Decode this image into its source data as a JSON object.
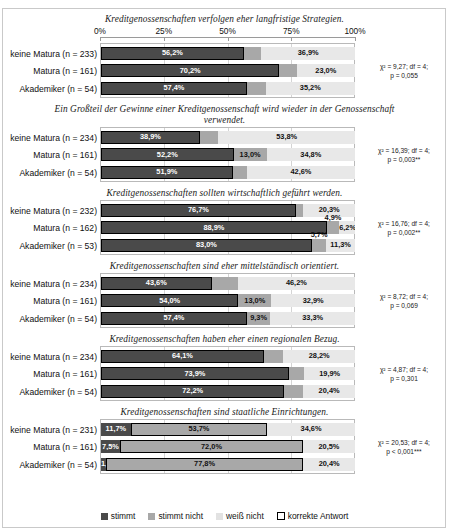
{
  "axis": {
    "ticks": [
      "0%",
      "25%",
      "50%",
      "75%",
      "100%"
    ],
    "values": [
      0,
      25,
      50,
      75,
      100
    ],
    "min": 0,
    "max": 100
  },
  "legend": {
    "items": [
      {
        "label": "stimmt",
        "color": "#4a4a4a",
        "key": "stimmt"
      },
      {
        "label": "stimmt nicht",
        "color": "#a8a8a8",
        "key": "stimmt_nicht"
      },
      {
        "label": "weiß nicht",
        "color": "#e2e2e2",
        "key": "weiss_nicht"
      },
      {
        "label": "korrekte Antwort",
        "color": "#ffffff",
        "key": "korrekte_antwort"
      }
    ]
  },
  "chart_data": {
    "type": "bar",
    "orientation": "horizontal",
    "stacked": true,
    "xlabel": "",
    "ylabel": "",
    "xlim": [
      0,
      100
    ],
    "grid": true,
    "legend_position": "bottom",
    "series": [
      {
        "name": "stimmt",
        "color": "#4a4a4a"
      },
      {
        "name": "stimmt nicht",
        "color": "#a8a8a8"
      },
      {
        "name": "weiß nicht",
        "color": "#e2e2e2"
      }
    ],
    "categories": [
      "keine Matura",
      "Matura",
      "Akademiker"
    ],
    "panels": [
      {
        "title": "Kreditgenossenschaften verfolgen eher langfristige Strategien.",
        "stats": {
          "line1": "χ² = 9,27; df = 4;",
          "line2": "p = 0,055"
        },
        "correct_answer": "stimmt",
        "rows": [
          {
            "label": "keine Matura (n = 233)",
            "n": 233,
            "values": [
              56.2,
              6.9,
              36.9
            ],
            "labels": [
              "56,2%",
              "6,9%",
              "36,9%"
            ]
          },
          {
            "label": "Matura (n = 161)",
            "n": 161,
            "values": [
              70.2,
              6.8,
              23.0
            ],
            "labels": [
              "70,2%",
              "6,8%",
              "23,0%"
            ]
          },
          {
            "label": "Akademiker (n = 54)",
            "n": 54,
            "values": [
              57.4,
              7.4,
              35.2
            ],
            "labels": [
              "57,4%",
              "7,4%",
              "35,2%"
            ]
          }
        ]
      },
      {
        "title": "Ein Großteil der Gewinne einer Kreditgenossenschaft wird wieder in der Genossenschaft verwendet.",
        "stats": {
          "line1": "χ² = 16,39; df = 4;",
          "line2": "p = 0,003**"
        },
        "correct_answer": "stimmt",
        "rows": [
          {
            "label": "keine Matura (n = 234)",
            "n": 234,
            "values": [
              38.9,
              7.3,
              53.8
            ],
            "labels": [
              "38,9%",
              "7,3%",
              "53,8%"
            ]
          },
          {
            "label": "Matura (n = 161)",
            "n": 161,
            "values": [
              52.2,
              13.0,
              34.8
            ],
            "labels": [
              "52,2%",
              "13,0%",
              "34,8%"
            ]
          },
          {
            "label": "Akademiker (n = 54)",
            "n": 54,
            "values": [
              51.9,
              5.6,
              42.6
            ],
            "labels": [
              "51,9%",
              "5,6%",
              "42,6%"
            ]
          }
        ]
      },
      {
        "title": "Kreditgenossenschaften sollten wirtschaftlich geführt werden.",
        "stats": {
          "line1": "χ² = 16,76; df = 4;",
          "line2": "p = 0,002**"
        },
        "correct_answer": "stimmt",
        "rows": [
          {
            "label": "keine Matura (n = 232)",
            "n": 232,
            "values": [
              76.7,
              3.0,
              20.3
            ],
            "labels": [
              "76,7%",
              "3,0%",
              "20,3%"
            ]
          },
          {
            "label": "Matura (n = 162)",
            "n": 162,
            "values": [
              88.9,
              4.9,
              6.2
            ],
            "labels": [
              "88,9%",
              "4,9%",
              "6,2%"
            ]
          },
          {
            "label": "Akademiker (n = 53)",
            "n": 53,
            "values": [
              83.0,
              5.7,
              11.3
            ],
            "labels": [
              "83,0%",
              "5,7%",
              "11,3%"
            ]
          }
        ]
      },
      {
        "title": "Kreditgenossenschaften sind eher mittelständisch orientiert.",
        "stats": {
          "line1": "χ² = 8,72; df = 4;",
          "line2": "p = 0,069"
        },
        "correct_answer": "stimmt",
        "rows": [
          {
            "label": "keine Matura (n = 234)",
            "n": 234,
            "values": [
              43.6,
              10.3,
              46.2
            ],
            "labels": [
              "43,6%",
              "10,3%",
              "46,2%"
            ]
          },
          {
            "label": "Matura (n = 161)",
            "n": 161,
            "values": [
              54.0,
              13.0,
              32.9
            ],
            "labels": [
              "54,0%",
              "13,0%",
              "32,9%"
            ]
          },
          {
            "label": "Akademiker (n = 54)",
            "n": 54,
            "values": [
              57.4,
              9.3,
              33.3
            ],
            "labels": [
              "57,4%",
              "9,3%",
              "33,3%"
            ]
          }
        ]
      },
      {
        "title": "Kreditgenossenschaften haben eher einen regionalen Bezug.",
        "stats": {
          "line1": "χ² = 4,87; df = 4;",
          "line2": "p = 0,301"
        },
        "correct_answer": "stimmt",
        "rows": [
          {
            "label": "keine Matura (n = 234)",
            "n": 234,
            "values": [
              64.1,
              7.7,
              28.2
            ],
            "labels": [
              "64,1%",
              "7,7%",
              "28,2%"
            ]
          },
          {
            "label": "Matura (n = 161)",
            "n": 161,
            "values": [
              73.9,
              6.2,
              19.9
            ],
            "labels": [
              "73,9%",
              "6,2%",
              "19,9%"
            ]
          },
          {
            "label": "Akademiker (n = 54)",
            "n": 54,
            "values": [
              72.2,
              7.4,
              20.4
            ],
            "labels": [
              "72,2%",
              "7,4%",
              "20,4%"
            ]
          }
        ]
      },
      {
        "title": "Kreditgenossenschaften sind staatliche Einrichtungen.",
        "stats": {
          "line1": "χ² = 20,53; df = 4;",
          "line2": "p < 0,001***"
        },
        "correct_answer": "stimmt nicht",
        "rows": [
          {
            "label": "keine Matura (n = 231)",
            "n": 231,
            "values": [
              11.7,
              53.7,
              34.6
            ],
            "labels": [
              "11,7%",
              "53,7%",
              "34,6%"
            ]
          },
          {
            "label": "Matura (n = 161)",
            "n": 161,
            "values": [
              7.5,
              72.0,
              20.5
            ],
            "labels": [
              "7,5%",
              "72,0%",
              "20,5%"
            ]
          },
          {
            "label": "Akademiker (n = 54)",
            "n": 54,
            "values": [
              1.9,
              77.8,
              20.4
            ],
            "labels": [
              "1,9%",
              "77,8%",
              "20,4%"
            ]
          }
        ]
      }
    ]
  }
}
